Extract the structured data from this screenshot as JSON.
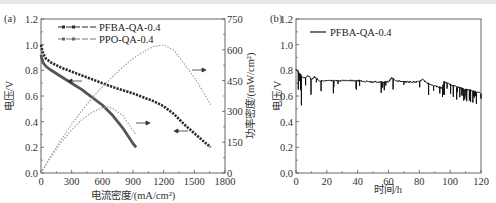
{
  "chart_data": [
    {
      "panel": "(a)",
      "type": "line",
      "title": "",
      "xlabel": "电流密度/(mA/cm²)",
      "ylabel": "电压/V",
      "y2label": "功率密度/(mW/cm²)",
      "xlim": [
        0,
        1800
      ],
      "ylim": [
        0.0,
        1.2
      ],
      "y2lim": [
        0,
        750
      ],
      "xticks": [
        "0",
        "300",
        "600",
        "900",
        "1200",
        "1500",
        "1800"
      ],
      "yticks": [
        "0.0",
        "0.2",
        "0.4",
        "0.6",
        "0.8",
        "1.0",
        "1.2"
      ],
      "y2ticks": [
        "0",
        "150",
        "300",
        "450",
        "600",
        "750"
      ],
      "legend": [
        "PFBA-QA-0.4",
        "PPO-QA-0.4"
      ],
      "legend_position": "upper left",
      "series": [
        {
          "name": "PFBA-QA-0.4 voltage",
          "axis": "left",
          "x": [
            0,
            20,
            50,
            100,
            200,
            300,
            400,
            500,
            600,
            700,
            800,
            900,
            1000,
            1100,
            1200,
            1300,
            1400,
            1500,
            1600,
            1660
          ],
          "y": [
            1.0,
            0.93,
            0.89,
            0.86,
            0.82,
            0.79,
            0.76,
            0.73,
            0.7,
            0.67,
            0.645,
            0.62,
            0.59,
            0.56,
            0.52,
            0.46,
            0.38,
            0.31,
            0.24,
            0.2
          ]
        },
        {
          "name": "PPO-QA-0.4 voltage",
          "axis": "left",
          "x": [
            0,
            20,
            50,
            100,
            200,
            300,
            400,
            500,
            600,
            700,
            800,
            900,
            930
          ],
          "y": [
            0.92,
            0.86,
            0.83,
            0.8,
            0.75,
            0.7,
            0.65,
            0.59,
            0.53,
            0.45,
            0.35,
            0.23,
            0.2
          ]
        },
        {
          "name": "PFBA-QA-0.4 power density",
          "axis": "right",
          "x": [
            0,
            100,
            200,
            300,
            400,
            500,
            600,
            700,
            800,
            900,
            1000,
            1100,
            1200,
            1300,
            1400,
            1500,
            1600,
            1660
          ],
          "y": [
            0,
            86,
            164,
            237,
            304,
            365,
            420,
            469,
            516,
            558,
            590,
            616,
            624,
            598,
            532,
            465,
            384,
            332
          ]
        },
        {
          "name": "PPO-QA-0.4 power density",
          "axis": "right",
          "x": [
            0,
            100,
            200,
            300,
            400,
            500,
            600,
            650,
            700,
            800,
            900,
            930
          ],
          "y": [
            0,
            80,
            150,
            210,
            260,
            295,
            318,
            322,
            315,
            280,
            207,
            186
          ]
        }
      ],
      "annotations": [
        "arrow left on voltage curves",
        "arrow right on power curves"
      ]
    },
    {
      "panel": "(b)",
      "type": "line",
      "title": "",
      "xlabel": "时间/h",
      "ylabel": "电压/V",
      "xlim": [
        0,
        120
      ],
      "ylim": [
        0.0,
        1.2
      ],
      "xticks": [
        "0",
        "20",
        "40",
        "60",
        "80",
        "100",
        "120"
      ],
      "yticks": [
        "0.0",
        "0.2",
        "0.4",
        "0.6",
        "0.8",
        "1.0",
        "1.2"
      ],
      "legend": [
        "PFBA-QA-0.4"
      ],
      "legend_position": "upper left",
      "series": [
        {
          "name": "PFBA-QA-0.4",
          "x": [
            0,
            2,
            4,
            6,
            8,
            10,
            12,
            15,
            20,
            30,
            40,
            50,
            60,
            62,
            65,
            70,
            80,
            82,
            85,
            90,
            95,
            96,
            100,
            105,
            110,
            115,
            120
          ],
          "y": [
            0.81,
            0.78,
            0.75,
            0.74,
            0.76,
            0.73,
            0.75,
            0.72,
            0.72,
            0.72,
            0.72,
            0.71,
            0.71,
            0.74,
            0.72,
            0.71,
            0.71,
            0.73,
            0.7,
            0.68,
            0.66,
            0.71,
            0.69,
            0.67,
            0.65,
            0.64,
            0.62
          ]
        }
      ]
    }
  ],
  "panels": {
    "a": {
      "label": "(a)",
      "xlabel": "电流密度/(mA/cm²)",
      "ylabel": "电压/V",
      "y2label": "功率密度/(mW/cm²)",
      "xticks": [
        "0",
        "300",
        "600",
        "900",
        "1200",
        "1500",
        "1800"
      ],
      "yticks": [
        "0.0",
        "0.2",
        "0.4",
        "0.6",
        "0.8",
        "1.0",
        "1.2"
      ],
      "y2ticks": [
        "0",
        "150",
        "300",
        "450",
        "600",
        "750"
      ],
      "legend": [
        "PFBA-QA-0.4",
        "PPO-QA-0.4"
      ]
    },
    "b": {
      "label": "(b)",
      "xlabel": "时间/h",
      "ylabel": "电压/V",
      "xticks": [
        "0",
        "20",
        "40",
        "60",
        "80",
        "100",
        "120"
      ],
      "yticks": [
        "0.0",
        "0.2",
        "0.4",
        "0.6",
        "0.8",
        "1.0",
        "1.2"
      ],
      "legend": [
        "PFBA-QA-0.4"
      ]
    }
  },
  "colors": {
    "pfba": "#2a2a2a",
    "ppo": "#555555",
    "power": "#9a9a9a",
    "axis": "#555555"
  }
}
